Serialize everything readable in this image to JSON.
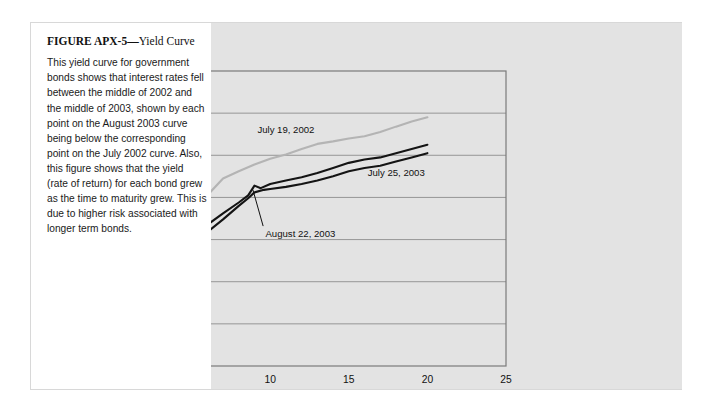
{
  "figure": {
    "title_label": "FIGURE APX-5",
    "title_dash": "—",
    "title_subject": "Yield Curve",
    "caption": "This yield curve for government bonds shows that interest rates fell between the middle of 2002 and the middle of 2003, shown by each point on the August 2003 curve being below the corresponding point on the July 2002 curve. Also, this figure shows that the yield (rate of return) for each bond grew as the time to maturity grew. This is due to higher risk associated with longer term bonds."
  },
  "colors": {
    "panel_background": "#e3e3e3",
    "plot_frame": "#7a7a7a",
    "gridline": "#8d8d8d",
    "series_2002": "#b4b4b4",
    "series_july_2003": "#141414",
    "series_august_2003": "#141414",
    "text": "#111111"
  },
  "chart_data": {
    "type": "line",
    "title": "",
    "xlabel": "Years to Maturity",
    "ylabel": "Percent (%)",
    "xlim": [
      0,
      25
    ],
    "ylim": [
      0,
      7
    ],
    "xticks": [
      0,
      5,
      10,
      15,
      20,
      25
    ],
    "yticks": [
      0,
      1,
      2,
      3,
      4,
      5,
      6,
      7
    ],
    "xtick_labels": [
      "0",
      "5",
      "10",
      "15",
      "20",
      "25"
    ],
    "ytick_labels": [
      "0",
      "1",
      "2",
      "3",
      "4",
      "5",
      "6",
      "7"
    ],
    "grid": "horizontal",
    "legend": "inline-annotations",
    "series": [
      {
        "name": "July 19, 2002",
        "color": "#b4b4b4",
        "label_x": 11.0,
        "label_y": 5.62,
        "points": [
          [
            1.5,
            1.7
          ],
          [
            2.0,
            1.95
          ],
          [
            2.5,
            2.25
          ],
          [
            3.0,
            2.55
          ],
          [
            4.0,
            3.05
          ],
          [
            5.0,
            3.55
          ],
          [
            6.0,
            4.05
          ],
          [
            7.0,
            4.45
          ],
          [
            8.0,
            4.62
          ],
          [
            9.0,
            4.78
          ],
          [
            10.0,
            4.92
          ],
          [
            11.0,
            5.02
          ],
          [
            12.0,
            5.15
          ],
          [
            13.0,
            5.27
          ],
          [
            14.0,
            5.33
          ],
          [
            15.0,
            5.4
          ],
          [
            16.0,
            5.45
          ],
          [
            17.0,
            5.55
          ],
          [
            18.0,
            5.68
          ],
          [
            19.0,
            5.8
          ],
          [
            20.0,
            5.9
          ]
        ]
      },
      {
        "name": "July 25, 2003",
        "color": "#141414",
        "label_x": 16.2,
        "label_y": 4.6,
        "points": [
          [
            1.5,
            1.0
          ],
          [
            2.0,
            1.28
          ],
          [
            2.5,
            1.58
          ],
          [
            3.0,
            1.88
          ],
          [
            4.0,
            2.45
          ],
          [
            5.0,
            3.02
          ],
          [
            6.0,
            3.35
          ],
          [
            7.0,
            3.62
          ],
          [
            8.0,
            3.88
          ],
          [
            8.6,
            4.05
          ],
          [
            9.0,
            4.28
          ],
          [
            9.4,
            4.22
          ],
          [
            10.0,
            4.32
          ],
          [
            11.0,
            4.4
          ],
          [
            12.0,
            4.48
          ],
          [
            13.0,
            4.58
          ],
          [
            14.0,
            4.7
          ],
          [
            15.0,
            4.82
          ],
          [
            16.0,
            4.9
          ],
          [
            17.0,
            4.95
          ],
          [
            18.0,
            5.05
          ],
          [
            19.0,
            5.15
          ],
          [
            20.0,
            5.25
          ]
        ]
      },
      {
        "name": "August 22, 2003",
        "color": "#141414",
        "label_x": 9.7,
        "label_y": 3.15,
        "leader_from": [
          9.55,
          3.32
        ],
        "leader_to": [
          8.9,
          4.18
        ],
        "points": [
          [
            1.5,
            1.0
          ],
          [
            2.0,
            1.22
          ],
          [
            2.5,
            1.48
          ],
          [
            3.0,
            1.75
          ],
          [
            4.0,
            2.28
          ],
          [
            5.0,
            2.82
          ],
          [
            6.0,
            3.18
          ],
          [
            7.0,
            3.48
          ],
          [
            8.0,
            3.8
          ],
          [
            8.6,
            3.98
          ],
          [
            9.0,
            4.12
          ],
          [
            9.6,
            4.18
          ],
          [
            10.0,
            4.2
          ],
          [
            11.0,
            4.25
          ],
          [
            12.0,
            4.32
          ],
          [
            13.0,
            4.4
          ],
          [
            14.0,
            4.5
          ],
          [
            15.0,
            4.62
          ],
          [
            16.0,
            4.7
          ],
          [
            17.0,
            4.75
          ],
          [
            18.0,
            4.85
          ],
          [
            19.0,
            4.95
          ],
          [
            20.0,
            5.05
          ]
        ]
      }
    ]
  }
}
